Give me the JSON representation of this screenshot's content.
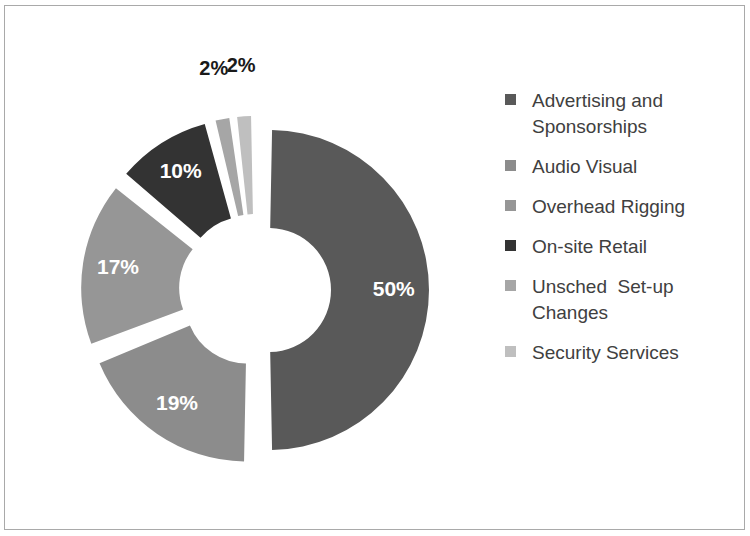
{
  "chart_data": {
    "type": "pie",
    "subtype": "exploded-doughnut",
    "title": "",
    "subtitle": "",
    "xlabel": "",
    "ylabel": "",
    "legend_position": "right",
    "grid": false,
    "value_suffix": "%",
    "categories": [
      "Advertising and Sponsorships",
      "Audio Visual",
      "Overhead Rigging",
      "On-site Retail",
      "Unsched  Set-up Changes",
      "Security Services"
    ],
    "values": [
      50,
      19,
      17,
      10,
      2,
      2
    ],
    "data_labels": [
      "50%",
      "19%",
      "17%",
      "10%",
      "2%",
      "2%"
    ],
    "colors": [
      "#595959",
      "#8c8c8c",
      "#969696",
      "#333333",
      "#a6a6a6",
      "#bfbfbf"
    ],
    "label_colors": [
      "#ffffff",
      "#ffffff",
      "#ffffff",
      "#ffffff",
      "#1a1a1a",
      "#1a1a1a"
    ],
    "label_placement": [
      "inside",
      "inside",
      "inside",
      "inside",
      "outside",
      "outside"
    ],
    "slices": [
      {
        "label": "Advertising and Sponsorships",
        "value": 50,
        "display": "50%",
        "color": "#595959"
      },
      {
        "label": "Audio Visual",
        "value": 19,
        "display": "19%",
        "color": "#8c8c8c"
      },
      {
        "label": "Overhead Rigging",
        "value": 17,
        "display": "17%",
        "color": "#969696"
      },
      {
        "label": "On-site Retail",
        "value": 10,
        "display": "10%",
        "color": "#333333"
      },
      {
        "label": "Unsched  Set-up Changes",
        "value": 2,
        "display": "2%",
        "color": "#a6a6a6"
      },
      {
        "label": "Security Services",
        "value": 2,
        "display": "2%",
        "color": "#bfbfbf"
      }
    ]
  },
  "legend": {
    "items": [
      {
        "label": "Advertising and Sponsorships",
        "color": "#595959"
      },
      {
        "label": "Audio Visual",
        "color": "#8c8c8c"
      },
      {
        "label": "Overhead Rigging",
        "color": "#969696"
      },
      {
        "label": "On-site Retail",
        "color": "#333333"
      },
      {
        "label": "Unsched  Set-up Changes",
        "color": "#a6a6a6"
      },
      {
        "label": "Security Services",
        "color": "#bfbfbf"
      }
    ]
  },
  "geometry": {
    "cx": 255,
    "cy": 290,
    "outer_radius": 160,
    "inner_radius": 62,
    "explode_offset": 14,
    "start_angle_deg": -90,
    "gap_deg": 2.2
  },
  "frame": {
    "border_color": "#a9a9a9",
    "background": "#ffffff"
  }
}
